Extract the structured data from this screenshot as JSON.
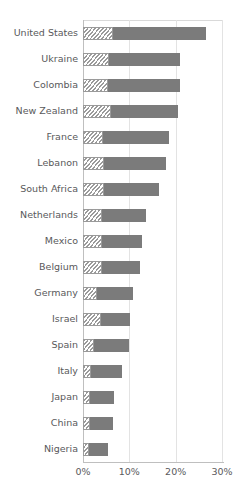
{
  "chart_data": {
    "type": "bar",
    "orientation": "horizontal",
    "stacked": true,
    "title": "",
    "subtitle": "",
    "xlabel": "",
    "ylabel": "",
    "xlim": [
      0,
      30
    ],
    "xtick_labels": [
      "0%",
      "10%",
      "20%",
      "30%"
    ],
    "xtick_values": [
      0,
      10,
      20,
      30
    ],
    "grid": "vertical",
    "legend": "none",
    "value_unit": "%",
    "categories": [
      "United States",
      "Ukraine",
      "Colombia",
      "New Zealand",
      "France",
      "Lebanon",
      "South Africa",
      "Netherlands",
      "Mexico",
      "Belgium",
      "Germany",
      "Israel",
      "Spain",
      "Italy",
      "Japan",
      "China",
      "Nigeria"
    ],
    "series": [
      {
        "name": "segment-1",
        "style": "hatched",
        "color": "#ffffff",
        "hatch_color": "#9a9a9a",
        "values": [
          6.5,
          5.7,
          5.5,
          6.0,
          4.3,
          4.5,
          4.5,
          4.0,
          4.0,
          4.0,
          3.0,
          3.8,
          2.3,
          1.7,
          1.5,
          1.5,
          1.3
        ]
      },
      {
        "name": "segment-2",
        "style": "solid",
        "color": "#7b7b7b",
        "values": [
          20.0,
          15.3,
          15.5,
          14.5,
          14.2,
          13.5,
          12.0,
          9.5,
          8.8,
          8.3,
          7.7,
          6.4,
          7.7,
          6.8,
          5.3,
          5.0,
          4.0
        ]
      }
    ],
    "totals": [
      26.5,
      21.0,
      21.0,
      20.5,
      18.5,
      18.0,
      16.5,
      13.5,
      12.8,
      12.3,
      10.7,
      10.2,
      10.0,
      8.5,
      6.8,
      6.5,
      5.3
    ]
  },
  "colors": {
    "axis": "#bfbfbf",
    "gridline": "#e3e3e3",
    "frame_top": "#d9d9d9",
    "text": "#59595b",
    "bar_solid": "#7b7b7b",
    "bar_hatch": "#9a9a9a",
    "background": "#ffffff"
  }
}
